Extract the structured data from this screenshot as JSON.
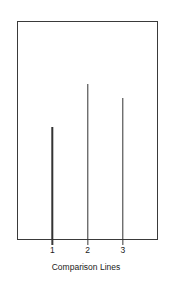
{
  "chart_data": {
    "type": "bar",
    "title": "",
    "subtitle": "",
    "xlabel": "Comparison Lines",
    "ylabel": "",
    "categories": [
      "1",
      "2",
      "3"
    ],
    "values": [
      0.516,
      0.712,
      0.648
    ],
    "ylim": [
      0,
      1
    ],
    "xlim": [
      0,
      4
    ],
    "x_positions": [
      1,
      2,
      3
    ],
    "grid": false,
    "legend": null,
    "legend_position": "none",
    "annotations": [],
    "series": [
      {
        "name": "Comparison Lines",
        "values": [
          0.516,
          0.712,
          0.648
        ]
      }
    ],
    "style": {
      "marks": "vertical-needle-lines",
      "line_color": "#333333",
      "line_width_px": 1.4,
      "frame_color": "#3a3a3a",
      "background": "#ffffff",
      "frame_visible": true,
      "y_axis_ticks_visible": false,
      "x_axis_ticks_visible": true
    }
  },
  "axis": {
    "x_tick_labels": [
      "1",
      "2",
      "3"
    ],
    "x_title": "Comparison Lines"
  }
}
